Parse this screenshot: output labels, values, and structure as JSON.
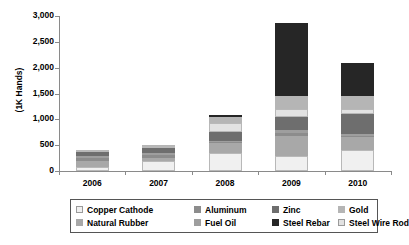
{
  "chart_data": {
    "type": "bar",
    "subtype": "stacked-bar",
    "title": "",
    "xlabel": "",
    "ylabel": "(1K Hands)",
    "ylim": [
      0,
      3000
    ],
    "ytick_labels": [
      "0",
      "500",
      "1,000",
      "1,500",
      "2,000",
      "2,500",
      "3,000"
    ],
    "ytick_values": [
      0,
      500,
      1000,
      1500,
      2000,
      2500,
      3000
    ],
    "grid": false,
    "legend_position": "bottom",
    "categories": [
      "2006",
      "2007",
      "2008",
      "2009",
      "2010"
    ],
    "series": [
      {
        "name": "Copper Cathode",
        "color": "#f0f0f0",
        "values": [
          80,
          190,
          350,
          300,
          400
        ]
      },
      {
        "name": "Natural Rubber",
        "color": "#a8a8a8",
        "values": [
          120,
          60,
          200,
          380,
          260
        ]
      },
      {
        "name": "Aluminum",
        "color": "#8c8c8c",
        "values": [
          60,
          60,
          10,
          60,
          20
        ]
      },
      {
        "name": "Fuel Oil",
        "color": "#9e9e9e",
        "values": [
          40,
          40,
          20,
          50,
          30
        ]
      },
      {
        "name": "Zinc",
        "color": "#6e6e6e",
        "values": [
          60,
          90,
          180,
          250,
          400
        ]
      },
      {
        "name": "Steel Wire Rod",
        "color": "#e2e2e2",
        "values": [
          20,
          40,
          170,
          160,
          100
        ]
      },
      {
        "name": "Gold",
        "color": "#b5b5b5",
        "values": [
          0,
          30,
          120,
          250,
          240
        ]
      },
      {
        "name": "Steel Rebar",
        "color": "#262626",
        "values": [
          0,
          0,
          30,
          1410,
          650
        ]
      }
    ],
    "totals": [
      380,
      510,
      1080,
      2860,
      2100
    ]
  },
  "legend": {
    "rows": [
      [
        {
          "label": "Copper Cathode",
          "swatch": "#f0f0f0",
          "outlined": true
        },
        {
          "label": "Aluminum",
          "swatch": "#8c8c8c",
          "outlined": false
        },
        {
          "label": "Zinc",
          "swatch": "#6e6e6e",
          "outlined": false
        },
        {
          "label": "Gold",
          "swatch": "#b5b5b5",
          "outlined": false
        }
      ],
      [
        {
          "label": "Natural Rubber",
          "swatch": "#a8a8a8",
          "outlined": false
        },
        {
          "label": "Fuel Oil",
          "swatch": "#9e9e9e",
          "outlined": false
        },
        {
          "label": "Steel Rebar",
          "swatch": "#262626",
          "outlined": false
        },
        {
          "label": "Steel Wire Rod",
          "swatch": "#e2e2e2",
          "outlined": true
        }
      ]
    ]
  },
  "axis": {
    "y_title": "(1K Hands)"
  }
}
